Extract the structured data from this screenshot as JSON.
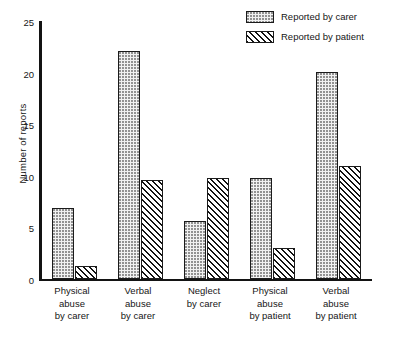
{
  "chart_data": {
    "type": "bar",
    "title": "",
    "xlabel": "",
    "ylabel": "Number of reports",
    "ylim": [
      0,
      25
    ],
    "yticks": [
      0,
      5,
      10,
      15,
      20,
      25
    ],
    "grid": false,
    "legend_position": "top-right",
    "categories": [
      "Physical abuse by carer",
      "Verbal abuse by carer",
      "Neglect by carer",
      "Physical abuse by patient",
      "Verbal abuse by patient"
    ],
    "category_lines": [
      [
        "Physical",
        "abuse",
        "by carer"
      ],
      [
        "Verbal",
        "abuse",
        "by carer"
      ],
      [
        "Neglect",
        "by carer"
      ],
      [
        "Physical",
        "abuse",
        "by patient"
      ],
      [
        "Verbal",
        "abuse",
        "by patient"
      ]
    ],
    "series": [
      {
        "name": "Reported by carer",
        "pattern": "dotted",
        "values": [
          6.8,
          22,
          5.6,
          9.7,
          20
        ]
      },
      {
        "name": "Reported by patient",
        "pattern": "hatched",
        "values": [
          1.2,
          9.5,
          9.7,
          3,
          10.9
        ]
      }
    ]
  },
  "legend": {
    "items": [
      {
        "label": "Reported by carer",
        "swatch": "dotted-swatch"
      },
      {
        "label": "Reported by patient",
        "swatch": "hatched-swatch"
      }
    ]
  },
  "colors": {
    "axis": "#131313",
    "bar_outline": "#1b1b1b",
    "dotted_fill": "#f1f1f1",
    "dotted_dot": "#8e8e8e",
    "hatch_line": "#131313",
    "text": "#161616",
    "background": "#ffffff"
  }
}
